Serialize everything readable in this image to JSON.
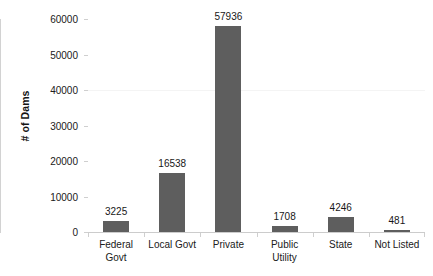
{
  "chart_data": {
    "type": "bar",
    "title": "",
    "subtitle": "",
    "xlabel": "",
    "ylabel": "# of Dams",
    "categories": [
      "Federal Govt",
      "Local Govt",
      "Private",
      "Public Utility",
      "State",
      "Not Listed"
    ],
    "category_lines": [
      [
        "Federal",
        "Govt"
      ],
      [
        "Local Govt",
        ""
      ],
      [
        "Private",
        ""
      ],
      [
        "Public",
        "Utility"
      ],
      [
        "State",
        ""
      ],
      [
        "Not Listed",
        ""
      ]
    ],
    "values": [
      3225,
      16538,
      57936,
      1708,
      4246,
      481
    ],
    "value_labels": [
      "3225",
      "16538",
      "57936",
      "1708",
      "4246",
      "481"
    ],
    "ylim": [
      0,
      60000
    ],
    "yticks": [
      0,
      10000,
      20000,
      30000,
      40000,
      50000,
      60000
    ],
    "ytick_labels": [
      "0",
      "10000",
      "20000",
      "30000",
      "40000",
      "50000",
      "60000"
    ],
    "grid": false,
    "legend": null,
    "legend_position": "none",
    "bar_color": "#5e5e5e",
    "axis_color": "#cccccc",
    "text_color": "#202020",
    "background": "#ffffff"
  }
}
